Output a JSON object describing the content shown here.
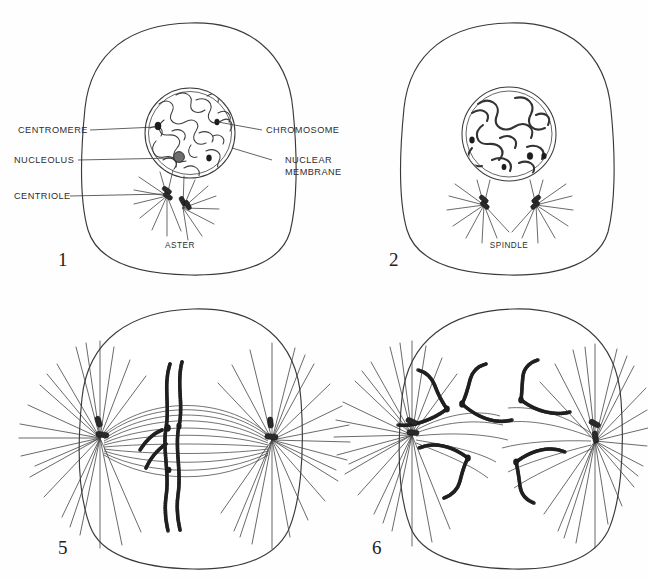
{
  "figure": {
    "background_color": "#ffffff",
    "ink_color": "#3a3a3a"
  },
  "panels": [
    {
      "number": "1",
      "stage_name": "prophase-early",
      "inner_labels": [
        {
          "name": "aster-label",
          "text": "ASTER"
        }
      ]
    },
    {
      "number": "2",
      "stage_name": "prophase-late",
      "inner_labels": [
        {
          "name": "spindle-label",
          "text": "SPINDLE"
        }
      ]
    },
    {
      "number": "5",
      "stage_name": "metaphase",
      "inner_labels": []
    },
    {
      "number": "6",
      "stage_name": "anaphase",
      "inner_labels": []
    }
  ],
  "callouts": {
    "left": [
      {
        "name": "centromere",
        "text": "CENTROMERE"
      },
      {
        "name": "nucleolus",
        "text": "NUCLEOLUS"
      },
      {
        "name": "centriole",
        "text": "CENTRIOLE"
      }
    ],
    "right": [
      {
        "name": "chromosome",
        "text": "CHROMOSOME"
      },
      {
        "name": "nuclear-membrane-line1",
        "text": "NUCLEAR"
      },
      {
        "name": "nuclear-membrane-line2",
        "text": "MEMBRANE"
      }
    ]
  }
}
